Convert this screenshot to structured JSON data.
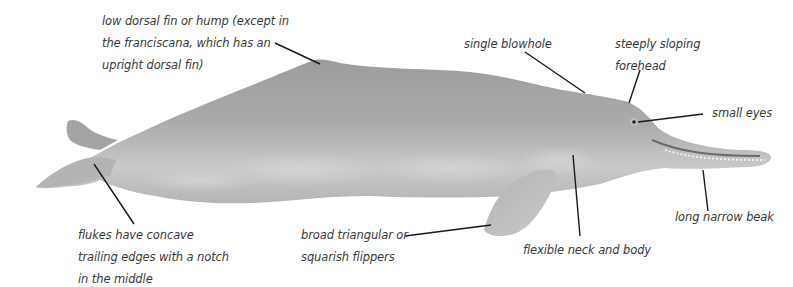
{
  "diagram": {
    "colors": {
      "background": "#ffffff",
      "body": "#a9a9a9",
      "body_light": "#cfcfcf",
      "body_dark": "#8e8e8e",
      "leader_line": "#1a1a1a",
      "label_text": "#3a3a3a"
    },
    "labels": {
      "dorsal": {
        "lines": [
          "low dorsal fin or hump (except in",
          "the franciscana, which has an",
          "upright dorsal fin)"
        ]
      },
      "blowhole": {
        "lines": [
          "single blowhole"
        ]
      },
      "forehead": {
        "lines": [
          "steeply sloping",
          "forehead"
        ]
      },
      "eyes": {
        "lines": [
          "small eyes"
        ]
      },
      "beak": {
        "lines": [
          "long narrow beak"
        ]
      },
      "neck": {
        "lines": [
          "flexible neck and body"
        ]
      },
      "flippers": {
        "lines": [
          "broad triangular or",
          "squarish flippers"
        ]
      },
      "flukes": {
        "lines": [
          "flukes have concave",
          "trailing edges with a notch",
          "in the middle"
        ]
      }
    }
  }
}
